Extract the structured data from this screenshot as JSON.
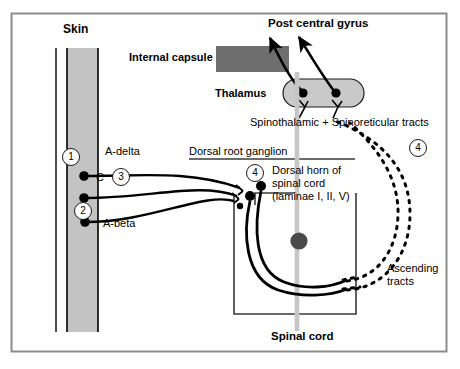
{
  "figure": {
    "border_color": "#8c8c8c",
    "background": "#ffffff"
  },
  "colors": {
    "skin_fill": "#c3c3c3",
    "internal_capsule_fill": "#6e6e6e",
    "thalamus_fill": "#c9c9c9",
    "midline_gray": "#c6c6c6",
    "central_dot": "#4a4a4a",
    "stroke": "#000000",
    "border": "#8c8c8c"
  },
  "labels": {
    "skin": "Skin",
    "internal_capsule": "Internal capsule",
    "post_central_gyrus": "Post central gyrus",
    "thalamus": "Thalamus",
    "spinothalamic_spinoreticular": "Spinothalamic + Spinoreticular tracts",
    "dorsal_root_ganglion": "Dorsal root ganglion",
    "a_delta": "A-delta",
    "c_fiber": "C",
    "a_beta": "A-beta",
    "dorsal_horn_line1": "Dorsal horn of",
    "dorsal_horn_line2": "spinal cord",
    "dorsal_horn_line3": "(laminae I, II, V)",
    "ascending_line1": "Ascending",
    "ascending_line2": "tracts",
    "spinal_cord": "Spinal cord"
  },
  "markers": {
    "one": "1",
    "two": "2",
    "three": "3",
    "four_dorsal_horn": "4",
    "four_right": "4"
  },
  "structures": [
    {
      "name": "skin-band",
      "shape": "vertical-band",
      "fill": "#c3c3c3"
    },
    {
      "name": "internal-capsule",
      "shape": "rectangle",
      "fill": "#6e6e6e"
    },
    {
      "name": "thalamus",
      "shape": "stadium",
      "fill": "#c9c9c9"
    },
    {
      "name": "spinal-cord-outline",
      "shape": "u-shape",
      "fill": "none"
    },
    {
      "name": "spinal-cord-midline",
      "shape": "vertical-line",
      "fill": "#c6c6c6"
    },
    {
      "name": "central-canal-dot",
      "shape": "circle",
      "fill": "#4a4a4a"
    }
  ],
  "fibers": [
    {
      "name": "a-delta",
      "marker": "1",
      "style": "solid"
    },
    {
      "name": "c-fiber",
      "marker": "3",
      "style": "solid"
    },
    {
      "name": "a-beta",
      "marker": "2",
      "style": "solid"
    },
    {
      "name": "ascending-tract-medial",
      "style": "dashed"
    },
    {
      "name": "ascending-tract-lateral",
      "style": "dashed"
    },
    {
      "name": "thalamocortical-medial",
      "style": "solid-arrow"
    },
    {
      "name": "thalamocortical-lateral",
      "style": "solid-arrow"
    }
  ]
}
